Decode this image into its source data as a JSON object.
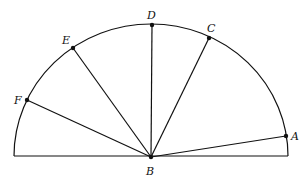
{
  "diagram": {
    "type": "semicircle with radii from center",
    "center_label": "B",
    "points": [
      {
        "label": "A"
      },
      {
        "label": "C"
      },
      {
        "label": "D"
      },
      {
        "label": "E"
      },
      {
        "label": "F"
      }
    ]
  }
}
